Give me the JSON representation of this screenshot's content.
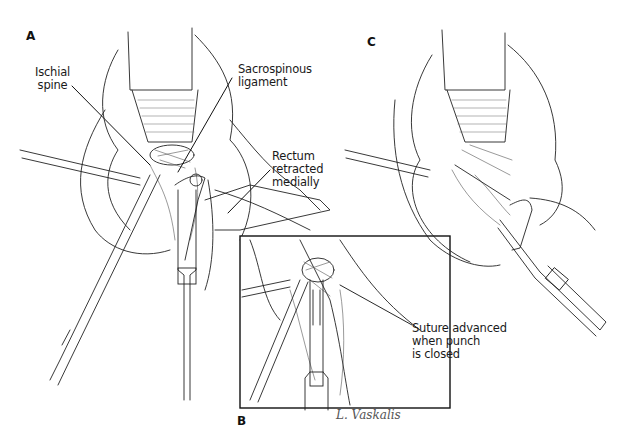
{
  "figure": {
    "panels": [
      {
        "id": "A",
        "label": "A"
      },
      {
        "id": "B",
        "label": "B"
      },
      {
        "id": "C",
        "label": "C"
      }
    ],
    "annotations": {
      "ischial_spine": [
        "Ischial",
        "spine"
      ],
      "sacrospinous_ligament": [
        "Sacrospinous",
        "ligament"
      ],
      "rectum": [
        "Rectum",
        "retracted",
        "medially"
      ],
      "suture": [
        "Suture advanced",
        "when punch",
        "is closed"
      ]
    },
    "signature": "L. Vaskalis"
  }
}
